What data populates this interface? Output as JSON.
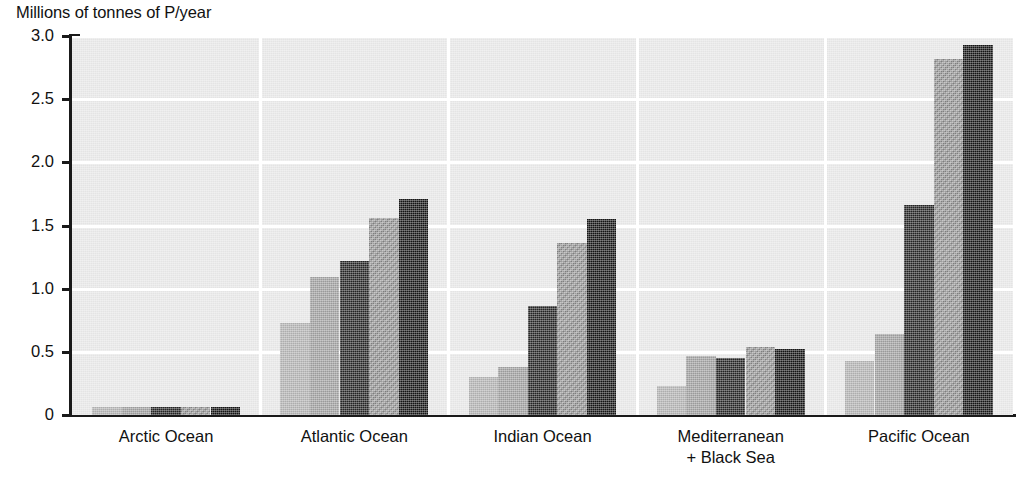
{
  "chart_data": {
    "type": "bar",
    "title": "Millions of tonnes of P/year",
    "xlabel": "",
    "ylabel": "Millions of tonnes of P/year",
    "ylim": [
      0,
      3.0
    ],
    "yticks": [
      "0",
      "0.5",
      "1.0",
      "1.5",
      "2.0",
      "2.5",
      "3.0"
    ],
    "ytick_values": [
      0,
      0.5,
      1.0,
      1.5,
      2.0,
      2.5,
      3.0
    ],
    "grid": "horizontal",
    "legend": "none",
    "categories": [
      "Arctic Ocean",
      "Atlantic Ocean",
      "Indian Ocean",
      "Mediterranean\n+ Black Sea",
      "Pacific Ocean"
    ],
    "series": [
      {
        "name": "series-1",
        "color": "#adadad",
        "values": [
          0.06,
          0.73,
          0.3,
          0.23,
          0.43
        ]
      },
      {
        "name": "series-2",
        "color": "#9a9a9a",
        "values": [
          0.06,
          1.09,
          0.38,
          0.47,
          0.64
        ]
      },
      {
        "name": "series-3",
        "color": "#232323",
        "values": [
          0.06,
          1.22,
          0.86,
          0.45,
          1.66
        ]
      },
      {
        "name": "series-4",
        "color": "#8c8c8c",
        "values": [
          0.06,
          1.56,
          1.36,
          0.54,
          2.82
        ]
      },
      {
        "name": "series-5",
        "color": "#141414",
        "values": [
          0.06,
          1.71,
          1.55,
          0.52,
          2.93
        ]
      }
    ]
  },
  "colors": {
    "plot_background": "#e4e4e4",
    "gridline": "#ffffff",
    "axis": "#1a1a1a",
    "text": "#111111"
  }
}
